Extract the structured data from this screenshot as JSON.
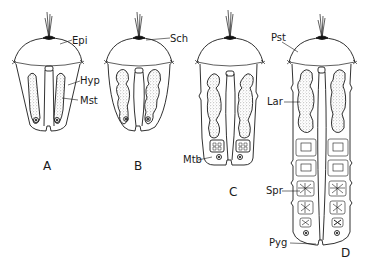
{
  "figure": {
    "stages": [
      {
        "id": "A",
        "label": "A"
      },
      {
        "id": "B",
        "label": "B"
      },
      {
        "id": "C",
        "label": "C"
      },
      {
        "id": "D",
        "label": "D"
      }
    ],
    "annotations": [
      {
        "label": "Epi",
        "stage": "A"
      },
      {
        "label": "Hyp",
        "stage": "A"
      },
      {
        "label": "Mst",
        "stage": "A"
      },
      {
        "label": "Sch",
        "stage": "B"
      },
      {
        "label": "Mtb",
        "stage": "C"
      },
      {
        "label": "Pst",
        "stage": "D"
      },
      {
        "label": "Lar",
        "stage": "D"
      },
      {
        "label": "Spr",
        "stage": "D"
      },
      {
        "label": "Pyg",
        "stage": "D"
      }
    ],
    "colors": {
      "ink": "#1a1a1a",
      "background": "#ffffff",
      "stipple": "#8a8a8a"
    }
  }
}
